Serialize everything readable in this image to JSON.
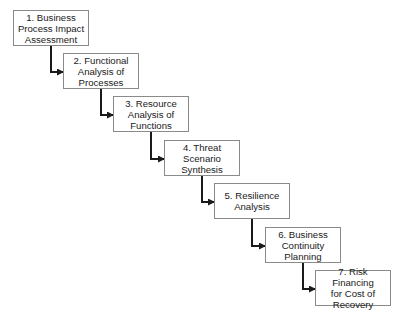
{
  "diagram": {
    "type": "staircase-flow",
    "line_color": "#1a1a1a",
    "box_border_color": "#8a8a8a",
    "steps": [
      {
        "number": 1,
        "label": "1. Business\nProcess Impact\nAssessment",
        "x": 13,
        "y": 10
      },
      {
        "number": 2,
        "label": "2. Functional\nAnalysis of\nProcesses",
        "x": 63,
        "y": 53
      },
      {
        "number": 3,
        "label": "3. Resource\nAnalysis of\nFunctions",
        "x": 113,
        "y": 96
      },
      {
        "number": 4,
        "label": "4. Threat\nScenario\nSynthesis",
        "x": 164,
        "y": 140
      },
      {
        "number": 5,
        "label": "5. Resilience\nAnalysis",
        "x": 214,
        "y": 183
      },
      {
        "number": 6,
        "label": "6. Business\nContinuity\nPlanning",
        "x": 265,
        "y": 227
      },
      {
        "number": 7,
        "label": "7. Risk Financing\nfor Cost of\nRecovery",
        "x": 315,
        "y": 270
      }
    ]
  }
}
